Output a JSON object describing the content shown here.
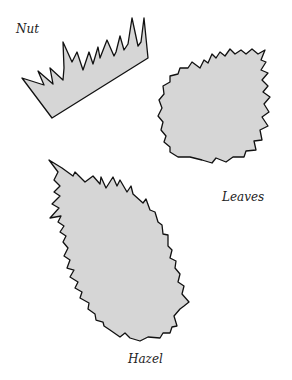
{
  "labels": {
    "nut": "Nut",
    "leaves": "Leaves",
    "hazel": "Hazel"
  },
  "shapes": {
    "fill": "#d6d6d6",
    "stroke": "#111111"
  }
}
